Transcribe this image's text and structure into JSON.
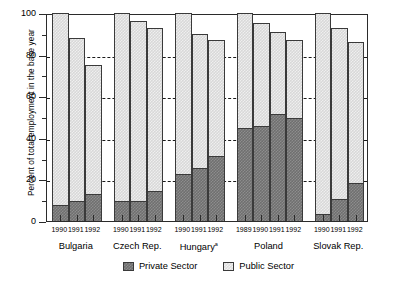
{
  "chart_data": {
    "type": "bar",
    "subtype": "stacked",
    "title": "",
    "xlabel": "",
    "ylabel": "Percent of total employment in the base year",
    "ylim": [
      0,
      100
    ],
    "yticks": [
      0,
      20,
      40,
      60,
      80,
      100
    ],
    "ytick_labels": [
      "0",
      "20",
      "40",
      "60",
      "80",
      "100"
    ],
    "yminor_ticks": [
      10,
      30,
      50,
      70,
      90
    ],
    "grid": "horizontal dashed at 20, 40, 60, 80",
    "gridlines": [
      20,
      40,
      60,
      80
    ],
    "legend_position": "bottom-center",
    "series": [
      {
        "name": "Private Sector",
        "color": "#6f6f6f",
        "values": [
          7,
          9,
          12.5,
          9,
          9,
          14,
          22,
          25,
          31,
          44,
          45,
          51,
          49,
          3,
          10,
          18
        ]
      },
      {
        "name": "Public Sector",
        "color": "#dedede",
        "values": [
          93,
          79,
          62.5,
          91,
          87,
          79,
          78,
          65,
          56,
          56,
          50,
          40,
          38,
          97,
          83,
          68
        ]
      }
    ],
    "totals": [
      100,
      88,
      75,
      100,
      96,
      93,
      100,
      90,
      87,
      100,
      95,
      91,
      87,
      100,
      93,
      86
    ],
    "groups": [
      {
        "country": "Bulgaria",
        "footnote": "",
        "years": [
          "1990",
          "1991",
          "1992"
        ],
        "bars": [
          {
            "year": "1990",
            "private": 7,
            "public": 93,
            "total": 100
          },
          {
            "year": "1991",
            "private": 9,
            "public": 79,
            "total": 88
          },
          {
            "year": "1992",
            "private": 12.5,
            "public": 62.5,
            "total": 75
          }
        ]
      },
      {
        "country": "Czech Rep.",
        "footnote": "",
        "years": [
          "1990",
          "1991",
          "1992"
        ],
        "bars": [
          {
            "year": "1990",
            "private": 9,
            "public": 91,
            "total": 100
          },
          {
            "year": "1991",
            "private": 9,
            "public": 87,
            "total": 96
          },
          {
            "year": "1992",
            "private": 14,
            "public": 79,
            "total": 93
          }
        ]
      },
      {
        "country": "Hungary",
        "footnote": "a",
        "years": [
          "1990",
          "1991",
          "1992"
        ],
        "bars": [
          {
            "year": "1990",
            "private": 22,
            "public": 78,
            "total": 100
          },
          {
            "year": "1991",
            "private": 25,
            "public": 65,
            "total": 90
          },
          {
            "year": "1992",
            "private": 31,
            "public": 56,
            "total": 87
          }
        ]
      },
      {
        "country": "Poland",
        "footnote": "",
        "years": [
          "1989",
          "1990",
          "1991",
          "1992"
        ],
        "bars": [
          {
            "year": "1989",
            "private": 44,
            "public": 56,
            "total": 100
          },
          {
            "year": "1990",
            "private": 45,
            "public": 50,
            "total": 95
          },
          {
            "year": "1991",
            "private": 51,
            "public": 40,
            "total": 91
          },
          {
            "year": "1992",
            "private": 49,
            "public": 38,
            "total": 87
          }
        ]
      },
      {
        "country": "Slovak Rep.",
        "footnote": "",
        "years": [
          "1990",
          "1991",
          "1992"
        ],
        "bars": [
          {
            "year": "1990",
            "private": 3,
            "public": 97,
            "total": 100
          },
          {
            "year": "1991",
            "private": 10,
            "public": 83,
            "total": 93
          },
          {
            "year": "1992",
            "private": 18,
            "public": 68,
            "total": 86
          }
        ]
      }
    ]
  },
  "legend": {
    "entries": [
      {
        "label": "Private Sector",
        "swatch": "private"
      },
      {
        "label": "Public Sector",
        "swatch": "public"
      }
    ]
  }
}
